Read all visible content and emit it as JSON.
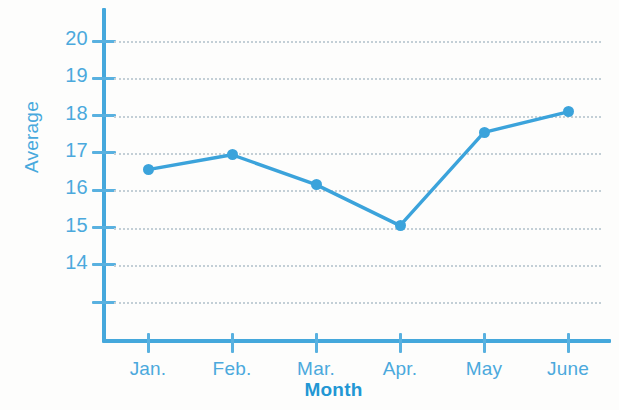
{
  "chart_data": {
    "type": "line",
    "title": "",
    "xlabel": "Month",
    "ylabel": "Average",
    "categories": [
      "Jan.",
      "Feb.",
      "Mar.",
      "Apr.",
      "May",
      "June"
    ],
    "values": [
      16.55,
      16.95,
      16.15,
      15.05,
      17.55,
      18.1
    ],
    "series": [
      {
        "name": "Average",
        "values": [
          16.55,
          16.95,
          16.15,
          15.05,
          17.55,
          18.1
        ]
      }
    ],
    "ytick_labels": [
      "20",
      "19",
      "18",
      "17",
      "16",
      "15",
      "14",
      ""
    ],
    "ytick_values": [
      20,
      19,
      18,
      17,
      16,
      15,
      14,
      13
    ],
    "ylim": [
      13,
      20.4
    ],
    "xlim": [
      0,
      7
    ],
    "grid": true,
    "grid_axis": "y",
    "legend": false,
    "axis_break": true,
    "colors": {
      "line": "#3ba3db",
      "marker": "#3ba3db",
      "axis": "#45a8dc",
      "tick_label": "#4ba9dd",
      "ylabel": "#48a9dd",
      "xlabel": "#2397d4",
      "gridline": "#c3cfd6",
      "background": "#fdfdfc"
    }
  }
}
